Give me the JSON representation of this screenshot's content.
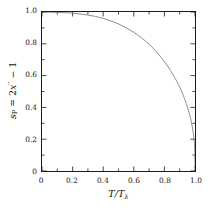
{
  "chart_data": {
    "type": "line",
    "title": "",
    "subtitle": "",
    "xlabel": "T/T_lambda",
    "xlabel_parts": {
      "num": "T",
      "den_base": "T",
      "den_sub": "λ"
    },
    "ylabel": "s_P = 2x'' − 1",
    "ylabel_parts": {
      "var": "s",
      "var_sub": "P",
      "equals": "=",
      "coef": "2",
      "x": "x",
      "x_sup": "′′",
      "minus_one": "− 1"
    },
    "xlim": [
      0,
      1.0
    ],
    "ylim": [
      0,
      1.0
    ],
    "grid": false,
    "legend": null,
    "legend_position": "none",
    "x_major_ticks": [
      0,
      0.2,
      0.4,
      0.6,
      0.8,
      1.0
    ],
    "x_major_tick_labels": [
      "0",
      "0.2",
      "0.4",
      "0.6",
      "0.8",
      "1.0"
    ],
    "x_minor_ticks": [
      0.1,
      0.3,
      0.5,
      0.7,
      0.9
    ],
    "y_major_ticks": [
      0,
      0.2,
      0.4,
      0.6,
      0.8,
      1.0
    ],
    "y_major_tick_labels": [
      "0",
      "0.2",
      "0.4",
      "0.6",
      "0.8",
      "1.0"
    ],
    "y_minor_ticks": [
      0.1,
      0.3,
      0.5,
      0.7,
      0.9
    ],
    "tick_direction": "in",
    "frame": "full",
    "series": [
      {
        "name": "order-parameter-curve",
        "color": "#808080",
        "line_width": 0.9,
        "x": [
          0.0,
          0.05,
          0.1,
          0.15,
          0.2,
          0.25,
          0.3,
          0.35,
          0.4,
          0.45,
          0.5,
          0.55,
          0.6,
          0.65,
          0.7,
          0.75,
          0.8,
          0.84,
          0.88,
          0.9,
          0.92,
          0.94,
          0.95,
          0.96,
          0.97,
          0.975,
          0.98,
          0.985,
          0.99,
          0.993,
          0.995,
          0.997,
          0.998,
          0.999,
          1.0
        ],
        "y": [
          1.0,
          0.999,
          0.998,
          0.996,
          0.993,
          0.988,
          0.981,
          0.972,
          0.96,
          0.944,
          0.925,
          0.901,
          0.872,
          0.838,
          0.797,
          0.748,
          0.688,
          0.632,
          0.566,
          0.527,
          0.483,
          0.432,
          0.403,
          0.371,
          0.334,
          0.313,
          0.289,
          0.262,
          0.23,
          0.205,
          0.185,
          0.159,
          0.142,
          0.115,
          0.02
        ]
      }
    ]
  },
  "axes": {
    "x_title_text": "T/Tλ",
    "y_title_text": "s_P = 2x′′ − 1"
  }
}
